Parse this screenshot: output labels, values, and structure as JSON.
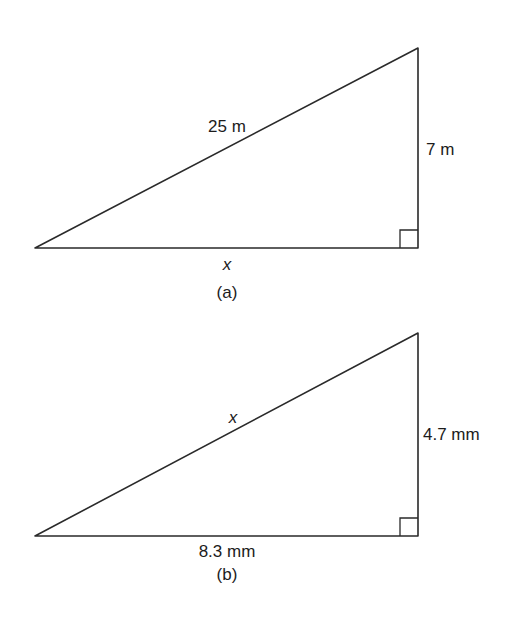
{
  "figures": [
    {
      "id": "a",
      "caption": "(a)",
      "hypotenuse_label": "25 m",
      "vertical_label": "7 m",
      "base_label": "x",
      "right_angle": "bottom-right"
    },
    {
      "id": "b",
      "caption": "(b)",
      "hypotenuse_label": "x",
      "vertical_label": "4.7 mm",
      "base_label": "8.3 mm",
      "right_angle": "bottom-right"
    }
  ],
  "colors": {
    "line": "#2a2a2a",
    "text": "#1c1c1c",
    "background": "#ffffff"
  }
}
